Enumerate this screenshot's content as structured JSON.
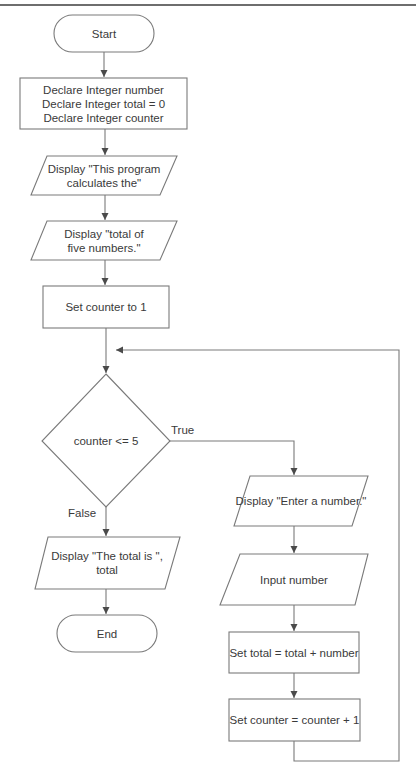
{
  "diagram": {
    "type": "flowchart",
    "colors": {
      "stroke": "#7a7a7a",
      "arrow": "#4a4a4a",
      "text": "#3a3a3a",
      "background": "#ffffff"
    },
    "nodes": {
      "start": {
        "shape": "terminal",
        "label": "Start"
      },
      "declare": {
        "shape": "process",
        "lines": [
          "Declare Integer number",
          "Declare Integer total = 0",
          "Declare Integer counter"
        ]
      },
      "display1": {
        "shape": "io",
        "lines": [
          "Display \"This program",
          "calculates the\""
        ]
      },
      "display2": {
        "shape": "io",
        "lines": [
          "Display \"total of",
          "five numbers.\""
        ]
      },
      "set_counter": {
        "shape": "process",
        "label": "Set counter to 1"
      },
      "decision": {
        "shape": "decision",
        "label": "counter <= 5"
      },
      "display_enter": {
        "shape": "io",
        "label": "Display \"Enter a number.\""
      },
      "input_number": {
        "shape": "io",
        "label": "Input number"
      },
      "set_total": {
        "shape": "process",
        "label": "Set total = total + number"
      },
      "increment": {
        "shape": "process",
        "label": "Set counter = counter + 1"
      },
      "display_total": {
        "shape": "io",
        "lines": [
          "Display \"The total is \",",
          "total"
        ]
      },
      "end": {
        "shape": "terminal",
        "label": "End"
      }
    },
    "edges": {
      "true_label": "True",
      "false_label": "False"
    }
  }
}
